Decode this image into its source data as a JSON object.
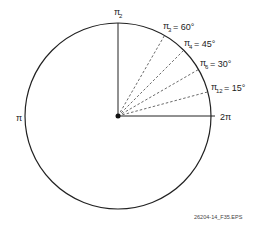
{
  "diagram": {
    "center": {
      "x": 118,
      "y": 116
    },
    "radius": 93,
    "axis_labels": {
      "top": {
        "num": "π",
        "den": "2"
      },
      "left": "π",
      "right": "2π"
    },
    "angles": [
      {
        "num": "π",
        "den": "3",
        "deg": "= 60°",
        "angle": 60
      },
      {
        "num": "π",
        "den": "4",
        "deg": "= 45°",
        "angle": 45
      },
      {
        "num": "π",
        "den": "6",
        "deg": "= 30°",
        "angle": 30
      },
      {
        "num": "π",
        "den": "12",
        "deg": "= 15°",
        "angle": 15
      }
    ],
    "caption": "26204-14_F35.EPS"
  }
}
